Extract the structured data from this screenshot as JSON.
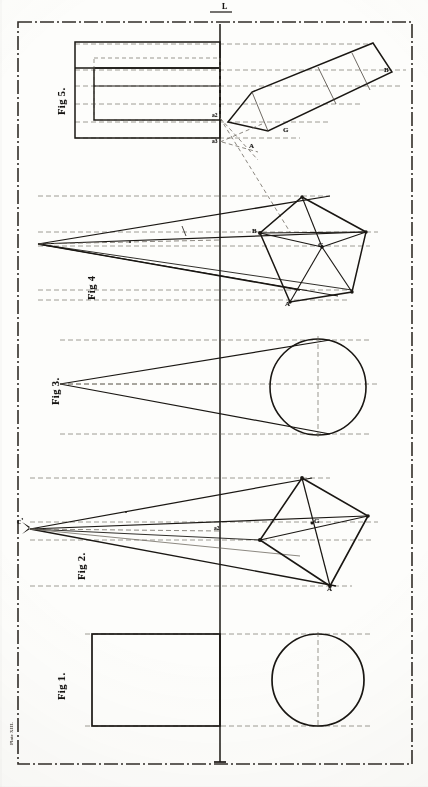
{
  "plate": {
    "title": "Descriptive geometry plate — five figures",
    "edge_note": "Plate XIII.",
    "axis_label": "L",
    "border_style": "dash-dot rule",
    "ink_color": "#1a1713",
    "paper_color": "#fdfdfb",
    "construction_color": "#6f6a61"
  },
  "figures": [
    {
      "id": "fig1",
      "label": "Fig 1.",
      "description": "Plan: circle; elevation: plain rectangle",
      "shapes": [
        "rectangle",
        "circle"
      ]
    },
    {
      "id": "fig2",
      "label": "Fig 2.",
      "description": "Perspective rays converging at vanishing point to a kite quadrilateral plan",
      "shapes": [
        "converging rays",
        "quadrilateral"
      ],
      "vanishing_point": "c'",
      "vertex_labels": [
        "A",
        "B",
        "D",
        "G"
      ]
    },
    {
      "id": "fig3",
      "label": "Fig 3.",
      "description": "Cone of rays to a circle",
      "shapes": [
        "converging rays",
        "circle"
      ]
    },
    {
      "id": "fig4",
      "label": "Fig 4",
      "description": "Rays converging to a pentagon with centre G and radii",
      "shapes": [
        "converging rays",
        "pentagon",
        "radii"
      ],
      "vertex_labels": [
        "A",
        "B",
        "D",
        "G"
      ],
      "centre_label": "G"
    },
    {
      "id": "fig5",
      "label": "Fig 5.",
      "description": "Nested rectangles in elevation; tilted rectangle in projection",
      "shapes": [
        "nested rectangles",
        "tilted rectangle"
      ],
      "vertex_labels": [
        "G",
        "B",
        "A"
      ]
    }
  ],
  "point_labels": [
    {
      "name": "c'",
      "figure": "fig2"
    },
    {
      "name": "a2",
      "figure": "fig2"
    },
    {
      "name": "G",
      "figure": "fig2"
    },
    {
      "name": "A",
      "figure": "fig2"
    },
    {
      "name": "B",
      "figure": "fig4"
    },
    {
      "name": "G",
      "figure": "fig4"
    },
    {
      "name": "A",
      "figure": "fig4"
    },
    {
      "name": "a2",
      "figure": "fig5"
    },
    {
      "name": "a3",
      "figure": "fig5"
    },
    {
      "name": "G",
      "figure": "fig5"
    },
    {
      "name": "A",
      "figure": "fig5"
    },
    {
      "name": "B",
      "figure": "fig5"
    }
  ]
}
